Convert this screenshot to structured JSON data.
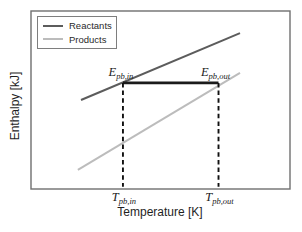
{
  "chart_data": {
    "type": "line",
    "title": "",
    "xlabel": "Temperature [K]",
    "ylabel": "Enthalpy [kJ]",
    "x_axis_numeric": false,
    "y_axis_numeric": false,
    "grid": false,
    "legend_position": "top-left inside",
    "frame_color": "#6f6f6f",
    "series": [
      {
        "name": "Reactants",
        "color": "#5c5c5c",
        "stroke_width": 2,
        "points_norm": [
          [
            0.193,
            0.5
          ],
          [
            0.807,
            0.876
          ]
        ]
      },
      {
        "name": "Products",
        "color": "#bcbcbc",
        "stroke_width": 2,
        "points_norm": [
          [
            0.181,
            0.107
          ],
          [
            0.807,
            0.652
          ]
        ]
      }
    ],
    "annotations": {
      "enthalpy_transfer_line": {
        "y_norm": 0.596,
        "x_from_norm": 0.355,
        "x_to_norm": 0.724,
        "color": "#1b1b1b",
        "stroke_width": 2.6
      },
      "dashed_guides": [
        {
          "x_norm": 0.355,
          "y_top_norm": 0.596,
          "y_bottom_norm": 0.012,
          "color": "#111111"
        },
        {
          "x_norm": 0.724,
          "y_top_norm": 0.596,
          "y_bottom_norm": 0.012,
          "color": "#111111"
        }
      ]
    }
  },
  "point_labels": {
    "e_in": {
      "base": "E",
      "sub": "pb,in"
    },
    "e_out": {
      "base": "E",
      "sub": "pb,out"
    },
    "t_in": {
      "base": "T",
      "sub": "pb,in"
    },
    "t_out": {
      "base": "T",
      "sub": "pb,out"
    }
  }
}
